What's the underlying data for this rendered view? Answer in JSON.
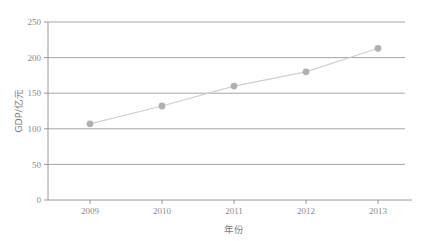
{
  "chart_data": {
    "type": "line",
    "title": "",
    "subtitle": "",
    "xlabel": "年份",
    "ylabel": "GDP/亿元",
    "categories": [
      "2009",
      "2010",
      "2011",
      "2012",
      "2013"
    ],
    "x": [
      2009,
      2010,
      2011,
      2012,
      2013
    ],
    "values": [
      107,
      132,
      160,
      180,
      213
    ],
    "series": [
      {
        "name": "GDP",
        "values": [
          107,
          132,
          160,
          180,
          213
        ]
      }
    ],
    "xlim": [
      2008.5,
      2013.5
    ],
    "ylim": [
      0,
      250
    ],
    "yticks": [
      0,
      50,
      100,
      150,
      200,
      250
    ],
    "ytick_labels": [
      "0",
      "50",
      "100",
      "150",
      "200",
      "250"
    ],
    "xticks": [
      2009,
      2010,
      2011,
      2012,
      2013
    ],
    "xtick_labels": [
      "2009",
      "2010",
      "2011",
      "2012",
      "2013"
    ],
    "grid": "horizontal",
    "legend": "none",
    "marker": "circle",
    "line_color": "#cfcfcf",
    "marker_color": "#b0b0b0",
    "grid_color": "#9a9a9a",
    "axis_color": "#8c8c8c",
    "text_color": "#8a8a8a",
    "background_color": "#ffffff",
    "points": [
      {
        "label": "2009",
        "x": 2009,
        "y": 107
      },
      {
        "label": "2010",
        "x": 2010,
        "y": 132
      },
      {
        "label": "2011",
        "x": 2011,
        "y": 160
      },
      {
        "label": "2012",
        "x": 2012,
        "y": 180
      },
      {
        "label": "2013",
        "x": 2013,
        "y": 213
      }
    ]
  },
  "axes": {
    "y_ticks": [
      {
        "label": "250"
      },
      {
        "label": "200"
      },
      {
        "label": "150"
      },
      {
        "label": "100"
      },
      {
        "label": "50"
      },
      {
        "label": "0"
      }
    ],
    "x_ticks": [
      {
        "label": "2009"
      },
      {
        "label": "2010"
      },
      {
        "label": "2011"
      },
      {
        "label": "2012"
      },
      {
        "label": "2013"
      }
    ],
    "y_title": "GDP/亿元",
    "x_title": "年份"
  }
}
